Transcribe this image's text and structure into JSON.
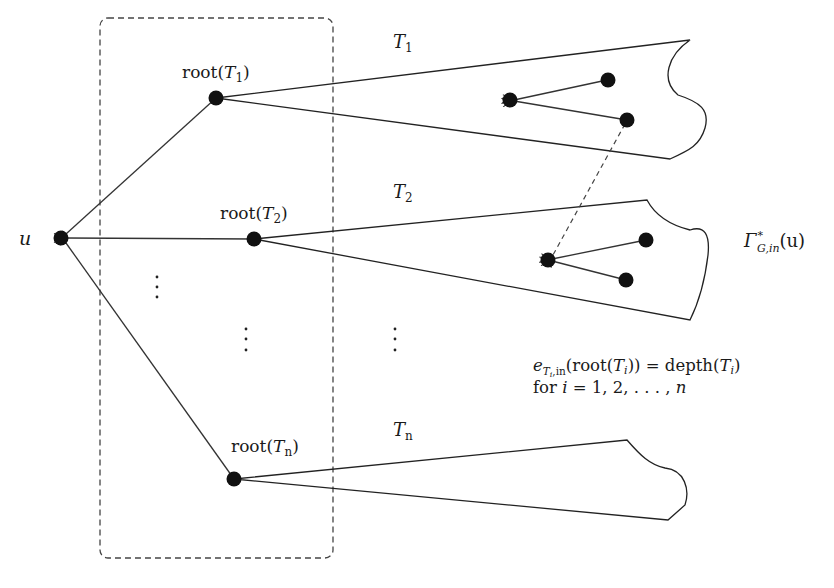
{
  "diagram": {
    "type": "tree-forest-in-arborescence",
    "nodes": {
      "u": {
        "label": "u"
      },
      "root_T1": {
        "label_pre": "root(",
        "label_var": "T",
        "label_sub": "1",
        "label_post": ")"
      },
      "root_T2": {
        "label_pre": "root(",
        "label_var": "T",
        "label_sub": "2",
        "label_post": ")"
      },
      "root_Tn": {
        "label_pre": "root(",
        "label_var": "T",
        "label_sub": "n",
        "label_post": ")"
      }
    },
    "trees": [
      {
        "name_var": "T",
        "name_sub": "1"
      },
      {
        "name_var": "T",
        "name_sub": "2"
      },
      {
        "name_var": "T",
        "name_sub": "n"
      }
    ],
    "edges": [
      {
        "from": "root_T1",
        "to": "u",
        "directed": true
      },
      {
        "from": "root_T2",
        "to": "u",
        "directed": true
      },
      {
        "from": "root_Tn",
        "to": "u",
        "directed": true
      },
      {
        "from": "T1_inner_b",
        "to": "T2_inner_a",
        "directed": true,
        "style": "dashed"
      }
    ],
    "gamma_label": {
      "main": "Γ",
      "sup": "*",
      "sub": "G,in",
      "arg": "(u)"
    },
    "ellipsis": "⋮",
    "formula": {
      "line1": {
        "e": "e",
        "sub_var": "T",
        "sub_sub": "i",
        "sub_rest": ",in",
        "mid1": "(root(",
        "var1": "T",
        "sub1": "i",
        "mid2": ")) = depth(",
        "var2": "T",
        "sub2": "i",
        "end": ")"
      },
      "line2": {
        "pre": "for ",
        "var": "i",
        "rest": " = 1, 2, . . . , ",
        "n": "n"
      }
    }
  }
}
